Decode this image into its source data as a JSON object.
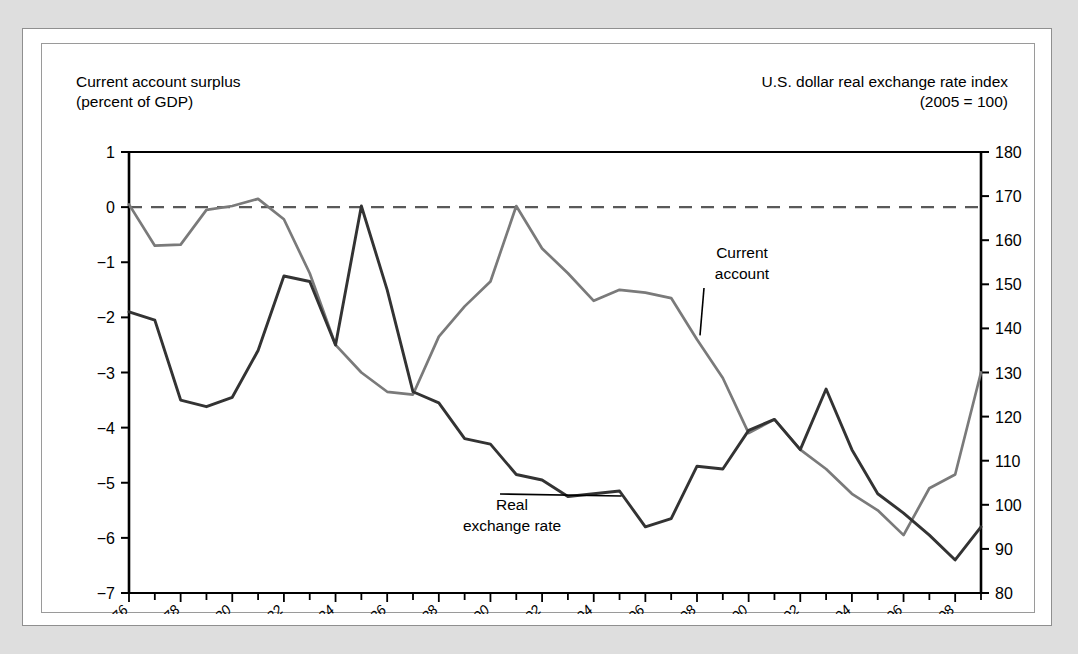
{
  "figure": {
    "left_axis_title": "Current account surplus\n(percent of GDP)",
    "right_axis_title": "U.S. dollar real exchange rate index\n(2005  = 100)"
  },
  "chart_data": {
    "type": "line",
    "title": "",
    "subtitle": "",
    "xlabel": "",
    "ylabel": "Current account surplus (percent of GDP)",
    "y2label": "U.S. dollar real exchange rate index (2005 = 100)",
    "grid": false,
    "legend": "inline-annotations",
    "xlim": [
      1976,
      2009
    ],
    "ylim": [
      -7,
      1
    ],
    "y2lim": [
      80,
      180
    ],
    "yticks": [
      "1",
      "0",
      "−1",
      "−2",
      "−3",
      "−4",
      "−5",
      "−6",
      "−7"
    ],
    "ytick_values": [
      1,
      0,
      -1,
      -2,
      -3,
      -4,
      -5,
      -6,
      -7
    ],
    "y2ticks": [
      "180",
      "170",
      "160",
      "150",
      "140",
      "130",
      "120",
      "110",
      "100",
      "90",
      "80"
    ],
    "y2tick_values": [
      180,
      170,
      160,
      150,
      140,
      130,
      120,
      110,
      100,
      90,
      80
    ],
    "xticks_major": [
      "1976",
      "1978",
      "1980",
      "1982",
      "1984",
      "1986",
      "1988",
      "1990",
      "1992",
      "1994",
      "1996",
      "1998",
      "2000",
      "2002",
      "2004",
      "2006",
      "2008"
    ],
    "xtick_values_major": [
      1976,
      1978,
      1980,
      1982,
      1984,
      1986,
      1988,
      1990,
      1992,
      1994,
      1996,
      1998,
      2000,
      2002,
      2004,
      2006,
      2008
    ],
    "xtick_values_all": [
      1976,
      1977,
      1978,
      1979,
      1980,
      1981,
      1982,
      1983,
      1984,
      1985,
      1986,
      1987,
      1988,
      1989,
      1990,
      1991,
      1992,
      1993,
      1994,
      1995,
      1996,
      1997,
      1998,
      1999,
      2000,
      2001,
      2002,
      2003,
      2004,
      2005,
      2006,
      2007,
      2008,
      2009
    ],
    "zero_reference_line": {
      "value": 0,
      "style": "dashed",
      "color": "#595959"
    },
    "x": [
      1976,
      1977,
      1978,
      1979,
      1980,
      1981,
      1982,
      1983,
      1984,
      1985,
      1986,
      1987,
      1988,
      1989,
      1990,
      1991,
      1992,
      1993,
      1994,
      1995,
      1996,
      1997,
      1998,
      1999,
      2000,
      2001,
      2002,
      2003,
      2004,
      2005,
      2006,
      2007,
      2008,
      2009
    ],
    "series": [
      {
        "name": "Current account",
        "axis": "left",
        "color": "#7a7a7a",
        "units": "percent of GDP",
        "values": [
          0.05,
          -0.7,
          -0.68,
          -0.05,
          0.02,
          0.15,
          -0.22,
          -1.2,
          -2.5,
          -3.0,
          -3.35,
          -3.4,
          -2.35,
          -1.8,
          -1.35,
          0.02,
          -0.75,
          -1.2,
          -1.7,
          -1.5,
          -1.55,
          -1.65,
          -2.4,
          -3.1,
          -4.1,
          -3.85,
          -4.4,
          -4.75,
          -5.2,
          -5.5,
          -5.95,
          -5.1,
          -4.85,
          -3.0
        ]
      },
      {
        "name": "Real exchange rate",
        "axis": "right",
        "color": "#333333",
        "units": "index, 2005 = 100",
        "values_left_scale": [
          -1.9,
          -2.05,
          -3.5,
          -3.62,
          -3.45,
          -2.6,
          -1.25,
          -1.35,
          -2.5,
          0.02,
          -1.5,
          -3.35,
          -3.55,
          -4.2,
          -4.3,
          -4.85,
          -4.95,
          -5.25,
          -5.2,
          -5.15,
          -5.8,
          -5.65,
          -4.7,
          -4.75,
          -4.05,
          -3.85,
          -4.4,
          -3.3,
          -4.4,
          -5.2,
          -5.55,
          -5.95,
          -6.4,
          -5.8
        ],
        "values": [
          143.8,
          142.2,
          123.8,
          122.8,
          124.4,
          133.0,
          146.5,
          145.5,
          133.8,
          168.0,
          153.0,
          128.0,
          126.0,
          117.5,
          116.5,
          110.5,
          109.3,
          105.5,
          106.0,
          106.5,
          98.5,
          100.0,
          111.8,
          111.2,
          119.5,
          121.8,
          115.0,
          128.8,
          115.0,
          107.0,
          102.6,
          97.5,
          92.0,
          100.0
        ]
      }
    ],
    "annotations": [
      {
        "text": "Current\naccount",
        "series": "Current account",
        "point_year": 1998,
        "leader": true
      },
      {
        "text": "Real\nexchange rate",
        "series": "Real exchange rate",
        "point_year": 1995,
        "leader": true
      }
    ]
  }
}
